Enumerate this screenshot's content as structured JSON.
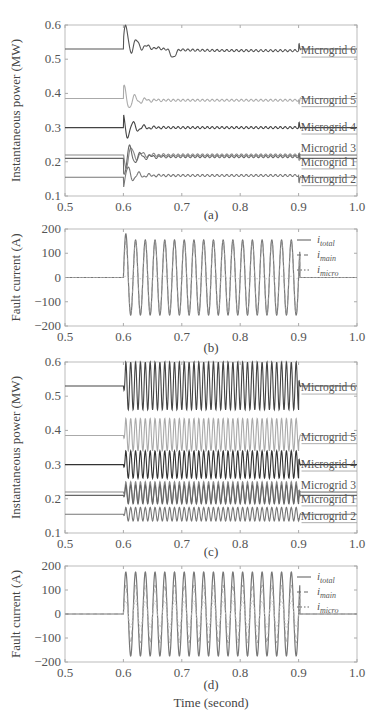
{
  "chart_data": [
    {
      "id": "a",
      "type": "line",
      "caption": "(a)",
      "ylabel": "Instantaneous power (MW)",
      "xlabel": "",
      "xlim": [
        0.5,
        1.0
      ],
      "ylim": [
        0.1,
        0.6
      ],
      "xticks": [
        "0.5",
        "0.6",
        "0.7",
        "0.8",
        "0.9",
        "1.0"
      ],
      "yticks": [
        "0.1",
        "0.2",
        "0.3",
        "0.4",
        "0.5",
        "0.6"
      ],
      "fault_start": 0.6,
      "fault_end": 0.9,
      "behavior": "transient-then-settle",
      "series": [
        {
          "name": "Microgrid 6",
          "pre_fault": 0.53,
          "during_fault": 0.525,
          "post_fault": 0.53,
          "color": "#555555"
        },
        {
          "name": "Microgrid 5",
          "pre_fault": 0.385,
          "during_fault": 0.38,
          "post_fault": 0.385,
          "color": "#aaaaaa"
        },
        {
          "name": "Microgrid 4",
          "pre_fault": 0.3,
          "during_fault": 0.3,
          "post_fault": 0.3,
          "color": "#444444"
        },
        {
          "name": "Microgrid 3",
          "pre_fault": 0.22,
          "during_fault": 0.22,
          "post_fault": 0.22,
          "color": "#888888"
        },
        {
          "name": "Microgrid 1",
          "pre_fault": 0.21,
          "during_fault": 0.215,
          "post_fault": 0.21,
          "color": "#666666"
        },
        {
          "name": "Microgrid 2",
          "pre_fault": 0.155,
          "during_fault": 0.16,
          "post_fault": 0.155,
          "color": "#777777"
        }
      ]
    },
    {
      "id": "b",
      "type": "line",
      "caption": "(b)",
      "ylabel": "Fault current (A)",
      "xlabel": "",
      "xlim": [
        0.5,
        1.0
      ],
      "ylim": [
        -200,
        200
      ],
      "xticks": [
        "0.5",
        "0.6",
        "0.7",
        "0.8",
        "0.9",
        "1.0"
      ],
      "yticks": [
        "-200",
        "-100",
        "0",
        "100",
        "200"
      ],
      "fault_start": 0.6,
      "fault_end": 0.9,
      "frequency_hz": 60,
      "legend": [
        {
          "base": "i",
          "sub": "total",
          "style": "solid"
        },
        {
          "base": "i",
          "sub": "main",
          "style": "dashed"
        },
        {
          "base": "i",
          "sub": "micro",
          "style": "dotted"
        }
      ],
      "series": [
        {
          "name": "i_total",
          "amplitude": 155,
          "first_peak": 180
        },
        {
          "name": "i_main",
          "amplitude": 150
        },
        {
          "name": "i_micro",
          "amplitude": 5
        }
      ]
    },
    {
      "id": "c",
      "type": "line",
      "caption": "(c)",
      "ylabel": "Instantaneous power (MW)",
      "xlabel": "",
      "xlim": [
        0.5,
        1.0
      ],
      "ylim": [
        0.1,
        0.6
      ],
      "xticks": [
        "0.5",
        "0.6",
        "0.7",
        "0.8",
        "0.9",
        "1.0"
      ],
      "yticks": [
        "0.1",
        "0.2",
        "0.3",
        "0.4",
        "0.5",
        "0.6"
      ],
      "fault_start": 0.6,
      "fault_end": 0.9,
      "behavior": "sustained-oscillation",
      "series": [
        {
          "name": "Microgrid 6",
          "pre_fault": 0.53,
          "osc_min": 0.46,
          "osc_max": 0.6,
          "post_fault": 0.53,
          "color": "#444444"
        },
        {
          "name": "Microgrid 5",
          "pre_fault": 0.385,
          "osc_min": 0.34,
          "osc_max": 0.435,
          "post_fault": 0.385,
          "color": "#aaaaaa"
        },
        {
          "name": "Microgrid 4",
          "pre_fault": 0.3,
          "osc_min": 0.26,
          "osc_max": 0.34,
          "post_fault": 0.3,
          "color": "#333333"
        },
        {
          "name": "Microgrid 3",
          "pre_fault": 0.22,
          "osc_min": 0.19,
          "osc_max": 0.25,
          "post_fault": 0.22,
          "color": "#888888"
        },
        {
          "name": "Microgrid 1",
          "pre_fault": 0.21,
          "osc_min": 0.185,
          "osc_max": 0.24,
          "post_fault": 0.21,
          "color": "#666666"
        },
        {
          "name": "Microgrid 2",
          "pre_fault": 0.155,
          "osc_min": 0.135,
          "osc_max": 0.175,
          "post_fault": 0.155,
          "color": "#777777"
        }
      ]
    },
    {
      "id": "d",
      "type": "line",
      "caption": "(d)",
      "ylabel": "Fault current (A)",
      "xlabel": "Time (second)",
      "xlim": [
        0.5,
        1.0
      ],
      "ylim": [
        -200,
        200
      ],
      "xticks": [
        "0.5",
        "0.6",
        "0.7",
        "0.8",
        "0.9",
        "1.0"
      ],
      "yticks": [
        "-200",
        "-100",
        "0",
        "100",
        "200"
      ],
      "fault_start": 0.6,
      "fault_end": 0.9,
      "frequency_hz": 60,
      "legend": [
        {
          "base": "i",
          "sub": "total",
          "style": "solid"
        },
        {
          "base": "i",
          "sub": "main",
          "style": "dashed"
        },
        {
          "base": "i",
          "sub": "micro",
          "style": "dotted"
        }
      ],
      "series": [
        {
          "name": "i_total",
          "amplitude": 175
        },
        {
          "name": "i_main",
          "amplitude": 120
        },
        {
          "name": "i_micro",
          "amplitude": 55
        }
      ]
    }
  ],
  "layout": {
    "panels": [
      {
        "x0": 65,
        "x1": 357,
        "y0": 25,
        "y1": 196,
        "caption_y": 219,
        "tick_y": 211
      },
      {
        "x0": 65,
        "x1": 357,
        "y0": 229,
        "y1": 326,
        "caption_y": 352,
        "tick_y": 341
      },
      {
        "x0": 65,
        "x1": 357,
        "y0": 362,
        "y1": 533,
        "caption_y": 556,
        "tick_y": 548
      },
      {
        "x0": 65,
        "x1": 357,
        "y0": 566,
        "y1": 662,
        "caption_y": 689,
        "tick_y": 677
      }
    ],
    "xlabel_y": 707
  }
}
